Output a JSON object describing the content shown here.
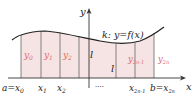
{
  "diagram": {
    "type": "simpson-rule-partition",
    "colors": {
      "fill": "#f6e4e4",
      "lines": "#555555",
      "axis": "#333333",
      "ordinate_labels": "#e06a6a",
      "text": "#222222"
    },
    "axis_labels": {
      "x": "x",
      "y": "y"
    },
    "curve_label": "k: y=f(x)",
    "strip_width_labels": [
      "l",
      "l"
    ],
    "ordinates": [
      "y0",
      "y1",
      "y2",
      "y2n-1",
      "y2n"
    ],
    "ordinate_display": {
      "y0": "y",
      "y0_sub": "0",
      "y1": "y",
      "y1_sub": "1",
      "y2": "y",
      "y2_sub": "2",
      "y2n1": "y",
      "y2n1_sub": "2n-1",
      "y2n": "y",
      "y2n_sub": "2n"
    },
    "x_ticks": {
      "a": "a",
      "eq": "=",
      "x0": "x",
      "x0_sub": "0",
      "x1": "x",
      "x1_sub": "1",
      "x2": "x",
      "x2_sub": "2",
      "dots": "····",
      "x2n1": "x",
      "x2n1_sub": "2n-1",
      "b": "b",
      "x2n": "x",
      "x2n_sub": "2n"
    }
  }
}
